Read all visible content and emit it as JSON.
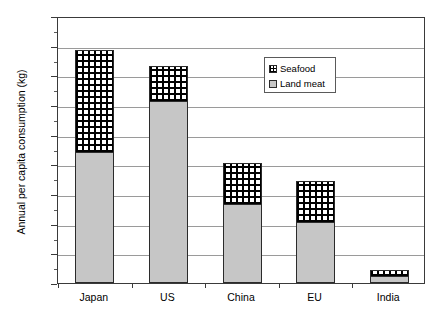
{
  "chart_data": {
    "type": "bar",
    "stacked": true,
    "title": "",
    "xlabel": "",
    "ylabel": "Annual per capita consumption (kg)",
    "ylim": [
      0,
      180
    ],
    "ytick_step": 20,
    "yticks": [
      0,
      20,
      40,
      60,
      80,
      100,
      120,
      140,
      160,
      180
    ],
    "ytick_labels": [
      "0",
      "20",
      "40",
      "60",
      "80",
      "100",
      "120",
      "140",
      "160",
      "180"
    ],
    "minor_tick_step": 10,
    "grid": true,
    "grid_axis": "y",
    "legend_position": "upper right",
    "categories": [
      "Japan",
      "US",
      "China",
      "EU",
      "India"
    ],
    "series": [
      {
        "name": "Land meat",
        "pattern": "solid-gray",
        "color": "#c6c6c6",
        "values": [
          88,
          123,
          53,
          41,
          5
        ]
      },
      {
        "name": "Seafood",
        "pattern": "grid-hatch",
        "color": "#ffffff",
        "values": [
          69,
          23,
          28,
          28,
          4
        ]
      }
    ],
    "totals": [
      157,
      146,
      81,
      69,
      9
    ]
  },
  "legend": {
    "entries": [
      {
        "label": "Seafood",
        "swatch": "grid-hatch-swatch"
      },
      {
        "label": "Land meat",
        "swatch": "gray-swatch"
      }
    ]
  },
  "axis": {
    "y_title": "Annual per capita consumption (kg)"
  }
}
